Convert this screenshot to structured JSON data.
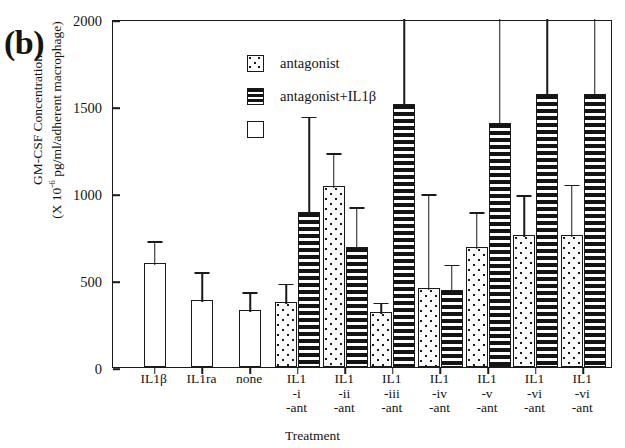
{
  "panel": {
    "letter": "(b)"
  },
  "axes": {
    "ylabel_line1": "GM-CSF Concentration",
    "ylabel_line2_pre": "(X 10",
    "ylabel_line2_sup": "-6",
    "ylabel_line2_post": " pg/ml/adherent macrophage)",
    "xlabel": "Treatment",
    "yticks": [
      "0",
      "500",
      "1000",
      "1500",
      "2000"
    ]
  },
  "legend": [
    {
      "name": "antagonist",
      "pattern": "dotted"
    },
    {
      "name": "antagonist+IL1β",
      "pattern": "striped"
    },
    {
      "name": "",
      "pattern": "open"
    }
  ],
  "chart_data": {
    "type": "bar",
    "title": "",
    "xlabel": "Treatment",
    "ylabel": "GM-CSF Concentration (X 10-6 pg/ml/adherent macrophage)",
    "ylim": [
      0,
      2000
    ],
    "yticks": [
      0,
      500,
      1000,
      1500,
      2000
    ],
    "grid": false,
    "legend_position": "upper-left inside plot",
    "categories": [
      "IL1β",
      "IL1ra",
      "none",
      "IL1-i-ant",
      "IL1-ii-ant",
      "IL1-iii-ant",
      "IL1-iv-ant",
      "IL1-v-ant",
      "IL1-vi-ant",
      "IL1-vi-ant"
    ],
    "category_label_lines": [
      [
        "IL1β"
      ],
      [
        "IL1ra"
      ],
      [
        "none"
      ],
      [
        "IL1",
        "-i",
        "-ant"
      ],
      [
        "IL1",
        "-ii",
        "-ant"
      ],
      [
        "IL1",
        "-iii",
        "-ant"
      ],
      [
        "IL1",
        "-iv",
        "-ant"
      ],
      [
        "IL1",
        "-v",
        "-ant"
      ],
      [
        "IL1",
        "-vi",
        "-ant"
      ],
      [
        "IL1",
        "-vi",
        "-ant"
      ]
    ],
    "series": [
      {
        "name": "control (open)",
        "pattern": "open",
        "values": [
          595,
          385,
          330,
          null,
          null,
          null,
          null,
          null,
          null,
          null
        ],
        "errors_high": [
          735,
          555,
          440,
          null,
          null,
          null,
          null,
          null,
          null,
          null
        ]
      },
      {
        "name": "antagonist",
        "pattern": "dotted",
        "values": [
          null,
          null,
          null,
          375,
          1040,
          315,
          455,
          690,
          760,
          760
        ],
        "errors_high": [
          null,
          null,
          null,
          490,
          1240,
          380,
          1005,
          900,
          1000,
          1060
        ]
      },
      {
        "name": "antagonist+IL1β",
        "pattern": "striped",
        "values": [
          null,
          null,
          null,
          890,
          690,
          1510,
          440,
          1400,
          1570,
          1570
        ],
        "errors_high": [
          null,
          null,
          null,
          1450,
          930,
          2060,
          600,
          2050,
          2060,
          2060
        ]
      }
    ]
  }
}
